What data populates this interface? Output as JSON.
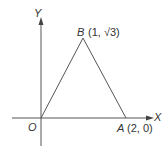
{
  "diagram": {
    "axes": {
      "x_label": "X",
      "y_label": "Y",
      "origin_label": "O"
    },
    "points": [
      {
        "name": "O",
        "coords": ""
      },
      {
        "name": "A",
        "coords": "(2, 0)"
      },
      {
        "name": "B",
        "coords": "(1, √3)"
      }
    ],
    "shape": "triangle OAB",
    "colors": {
      "stroke": "#555555",
      "text": "#333333"
    }
  }
}
